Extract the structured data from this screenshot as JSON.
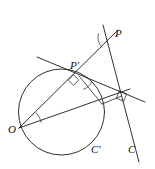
{
  "figure": {
    "width": 155,
    "height": 169,
    "background_color": "#ffffff",
    "stroke_color": "#1a1a1a"
  },
  "labels": {
    "o": "O",
    "p": "P",
    "p_prime": "P′",
    "c": "C",
    "c_prime": "C′"
  },
  "chart_data": {
    "type": "diagram",
    "xlim": [
      0,
      155
    ],
    "ylim": [
      0,
      169
    ],
    "grid": false,
    "legend": null,
    "circles": [
      {
        "name": "circle-c-prime",
        "label": "C′",
        "cx": 61.5,
        "cy": 112.0,
        "r": 43.0
      }
    ],
    "points": [
      {
        "name": "O",
        "label": "O",
        "x": 19.0,
        "y": 128.0,
        "label_x": 8,
        "label_y": 124
      },
      {
        "name": "P",
        "label": "P",
        "x": 113.0,
        "y": 37.0,
        "label_x": 115,
        "label_y": 28
      },
      {
        "name": "Pp",
        "label": "P′",
        "x": 79.0,
        "y": 76.0,
        "label_x": 70,
        "label_y": 60
      },
      {
        "name": "T",
        "label": "",
        "x": 102.0,
        "y": 104.0,
        "label_x": 0,
        "label_y": 0
      },
      {
        "name": "F",
        "label": "",
        "x": 121.5,
        "y": 96.0,
        "label_x": 0,
        "label_y": 0
      },
      {
        "name": "Cl",
        "label": "C",
        "x": 136.0,
        "y": 148.0,
        "label_x": 128,
        "label_y": 144
      },
      {
        "name": "Cp",
        "label": "C′",
        "x": 96.0,
        "y": 150.0,
        "label_x": 91,
        "label_y": 144
      }
    ],
    "segments": [
      {
        "name": "line-P-to-C",
        "x1": 103.0,
        "y1": 25.0,
        "x2": 139.0,
        "y2": 162.0
      },
      {
        "name": "line-O-through-Pp-to-P",
        "x1": 19.0,
        "y1": 128.0,
        "x2": 118.0,
        "y2": 30.0
      },
      {
        "name": "line-tangent-through-Pp",
        "x1": 37.0,
        "y1": 57.0,
        "x2": 145.0,
        "y2": 102.0
      },
      {
        "name": "line-O-to-T-extended",
        "x1": 19.0,
        "y1": 128.0,
        "x2": 130.0,
        "y2": 89.0
      },
      {
        "name": "segment-Pp-to-T",
        "x1": 79.0,
        "y1": 76.0,
        "x2": 102.0,
        "y2": 104.0
      },
      {
        "name": "segment-T-to-F",
        "x1": 102.0,
        "y1": 104.0,
        "x2": 121.5,
        "y2": 96.0
      }
    ],
    "angle_marks": [
      {
        "name": "angle-at-O",
        "vertex_x": 19.0,
        "vertex_y": 128.0,
        "radius": 23
      },
      {
        "name": "angle-at-P",
        "vertex_x": 113.0,
        "vertex_y": 37.0,
        "radius": 15
      },
      {
        "name": "angle-at-Pp",
        "vertex_x": 79.0,
        "vertex_y": 76.0,
        "radius": 14
      }
    ],
    "right_angle_marks": [
      {
        "name": "right-angle-at-Pp",
        "x": 73.5,
        "y": 80.0
      },
      {
        "name": "right-angle-at-F",
        "x": 121.5,
        "y": 96.0
      }
    ]
  }
}
